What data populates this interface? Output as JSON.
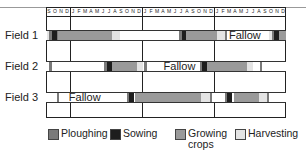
{
  "colors": {
    "ploughing": "#7a7a7a",
    "sowing": "#1e1e1e",
    "growing": "#9a9a9a",
    "harvesting": "#e4e4e4",
    "fallow": "#ffffff"
  },
  "timeline": {
    "months": [
      "S",
      "O",
      "N",
      "D",
      "J",
      "F",
      "M",
      "A",
      "M",
      "J",
      "J",
      "A",
      "S",
      "O",
      "N",
      "D",
      "J",
      "F",
      "M",
      "A",
      "M",
      "J",
      "J",
      "A",
      "S",
      "O",
      "N",
      "D",
      "J",
      "F",
      "M",
      "A",
      "M",
      "J",
      "J",
      "A",
      "S",
      "O",
      "N",
      "D"
    ],
    "year_dividers_after_month_index": [
      4,
      16,
      28
    ]
  },
  "fields": [
    {
      "label": "Field 1",
      "fallow_label": "Fallow",
      "fallow_label_month": 30.5,
      "segments": [
        {
          "type": "harvesting",
          "start": 0.1,
          "end": 0.5
        },
        {
          "type": "ploughing",
          "start": 0.5,
          "end": 1.0
        },
        {
          "type": "sowing",
          "start": 1.0,
          "end": 1.8
        },
        {
          "type": "ploughing",
          "start": 1.8,
          "end": 2.0
        },
        {
          "type": "growing",
          "start": 2.0,
          "end": 11.0
        },
        {
          "type": "harvesting",
          "start": 11.0,
          "end": 12.3
        },
        {
          "type": "ploughing",
          "start": 22.2,
          "end": 22.6
        },
        {
          "type": "sowing",
          "start": 22.6,
          "end": 23.4
        },
        {
          "type": "growing",
          "start": 23.4,
          "end": 28.5
        },
        {
          "type": "harvesting",
          "start": 28.5,
          "end": 29.8
        },
        {
          "type": "ploughing",
          "start": 29.8,
          "end": 30.2
        },
        {
          "type": "harvesting",
          "start": 37.2,
          "end": 37.6
        },
        {
          "type": "ploughing",
          "start": 37.6,
          "end": 38.0
        },
        {
          "type": "sowing",
          "start": 38.0,
          "end": 38.8
        },
        {
          "type": "growing",
          "start": 38.8,
          "end": 40.0
        }
      ]
    },
    {
      "label": "Field 2",
      "fallow_label": "Fallow",
      "fallow_label_month": 19.6,
      "segments": [
        {
          "type": "ploughing",
          "start": 0.5,
          "end": 1.0
        },
        {
          "type": "ploughing",
          "start": 9.6,
          "end": 10.1
        },
        {
          "type": "sowing",
          "start": 10.1,
          "end": 11.0
        },
        {
          "type": "growing",
          "start": 11.0,
          "end": 15.2
        },
        {
          "type": "harvesting",
          "start": 15.2,
          "end": 16.2
        },
        {
          "type": "ploughing",
          "start": 16.4,
          "end": 16.8
        },
        {
          "type": "ploughing",
          "start": 25.6,
          "end": 26.0
        },
        {
          "type": "sowing",
          "start": 26.0,
          "end": 26.9
        },
        {
          "type": "growing",
          "start": 26.9,
          "end": 33.5
        },
        {
          "type": "harvesting",
          "start": 33.5,
          "end": 34.5
        },
        {
          "type": "ploughing",
          "start": 35.6,
          "end": 36.0
        }
      ]
    },
    {
      "label": "Field 3",
      "fallow_label": "Fallow",
      "fallow_label_month": 3.8,
      "segments": [
        {
          "type": "ploughing",
          "start": 1.8,
          "end": 2.2
        },
        {
          "type": "ploughing",
          "start": 13.5,
          "end": 13.9
        },
        {
          "type": "sowing",
          "start": 13.9,
          "end": 14.7
        },
        {
          "type": "growing",
          "start": 14.9,
          "end": 25.9
        },
        {
          "type": "harvesting",
          "start": 25.9,
          "end": 27.3
        },
        {
          "type": "ploughing",
          "start": 27.3,
          "end": 27.7
        },
        {
          "type": "ploughing",
          "start": 29.8,
          "end": 30.2
        },
        {
          "type": "sowing",
          "start": 30.2,
          "end": 31.0
        },
        {
          "type": "growing",
          "start": 31.4,
          "end": 35.5
        },
        {
          "type": "harvesting",
          "start": 35.5,
          "end": 36.8
        },
        {
          "type": "ploughing",
          "start": 36.8,
          "end": 37.2
        }
      ]
    }
  ],
  "legend": [
    {
      "key": "ploughing",
      "label": "Ploughing",
      "x": 48
    },
    {
      "key": "sowing",
      "label": "Sowing",
      "x": 110
    },
    {
      "key": "growing",
      "label": "Growing crops",
      "x": 175
    },
    {
      "key": "harvesting",
      "label": "Harvesting",
      "x": 235
    }
  ]
}
